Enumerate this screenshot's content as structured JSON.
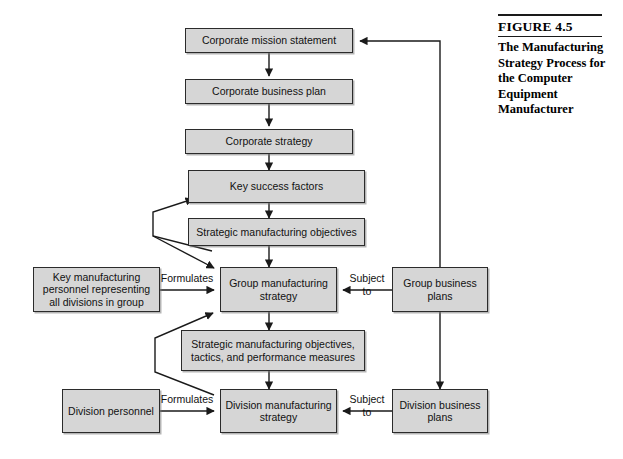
{
  "figure": {
    "number_label": "FIGURE 4.5",
    "title": "The Manufacturing Strategy Process for the Computer Equipment Manufacturer"
  },
  "diagram": {
    "type": "flowchart",
    "nodes": [
      {
        "id": "corporate-mission-statement",
        "label": "Corporate mission statement"
      },
      {
        "id": "corporate-business-plan",
        "label": "Corporate business plan"
      },
      {
        "id": "corporate-strategy",
        "label": "Corporate strategy"
      },
      {
        "id": "key-success-factors",
        "label": "Key success factors"
      },
      {
        "id": "strategic-manufacturing-objectives",
        "label": "Strategic manufacturing objectives"
      },
      {
        "id": "key-manufacturing-personnel",
        "label": "Key manufacturing personnel representing all divisions in group"
      },
      {
        "id": "group-manufacturing-strategy",
        "label": "Group manufacturing strategy"
      },
      {
        "id": "group-business-plans",
        "label": "Group business plans"
      },
      {
        "id": "strategic-objectives-tactics-measures",
        "label": "Strategic manufacturing objectives, tactics, and performance measures"
      },
      {
        "id": "division-personnel",
        "label": "Division personnel"
      },
      {
        "id": "division-manufacturing-strategy",
        "label": "Division manufacturing strategy"
      },
      {
        "id": "division-business-plans",
        "label": "Division business plans"
      }
    ],
    "edge_labels": {
      "formulates_group": "Formulates",
      "subject_to_group_line1": "Subject",
      "subject_to_group_line2": "to",
      "formulates_division": "Formulates",
      "subject_to_division_line1": "Subject",
      "subject_to_division_line2": "to"
    }
  },
  "colors": {
    "node_fill": "#d6d6d6",
    "node_border": "#2b2b2b",
    "line": "#1a1a1a",
    "page_background": "#ffffff"
  }
}
